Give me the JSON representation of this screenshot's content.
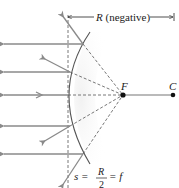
{
  "diagram": {
    "type": "optics-ray-diagram",
    "labels": {
      "radius": "R",
      "radius_note": "(negative)",
      "focal_point": "F",
      "center": "C",
      "equation_s": "s =",
      "fraction_num": "R",
      "fraction_den": "2",
      "equation_f": "= f"
    },
    "points": {
      "F": {
        "x": 123,
        "y": 95
      },
      "C": {
        "x": 173,
        "y": 95
      }
    },
    "outgoing_ray_heights": [
      44,
      72,
      95,
      126,
      154
    ],
    "colors": {
      "ray": "#8a8a8a",
      "mirror": "#555555",
      "dashed": "#555555",
      "text": "#222222",
      "point": "#111111"
    }
  }
}
